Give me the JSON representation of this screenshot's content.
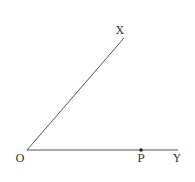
{
  "diagram": {
    "type": "angle",
    "colors": {
      "line": "#555555",
      "text": "#333333",
      "point": "#222222",
      "background": "#ffffff"
    },
    "points": {
      "O": {
        "label": "O",
        "x": 27,
        "y": 150
      },
      "X": {
        "label": "X",
        "x": 124,
        "y": 38
      },
      "Y": {
        "label": "Y",
        "x": 178,
        "y": 150
      },
      "P": {
        "label": "P",
        "x": 141,
        "y": 150
      }
    },
    "rays": [
      {
        "from": "O",
        "to": "X"
      },
      {
        "from": "O",
        "to": "Y"
      }
    ],
    "marked_points": [
      "P"
    ]
  }
}
